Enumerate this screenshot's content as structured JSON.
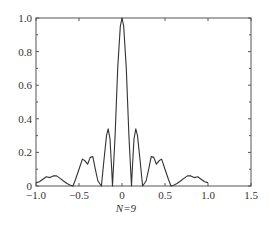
{
  "chart_data": {
    "type": "line",
    "title": "",
    "xlabel": "N=9",
    "ylabel": "",
    "xlim": [
      -1.0,
      1.5
    ],
    "ylim": [
      0,
      1.0
    ],
    "grid": false,
    "legend": null,
    "x_ticks": [
      -1.0,
      -0.5,
      0,
      0.5,
      1.0,
      1.5
    ],
    "x_tick_labels": [
      "−1.0",
      "−0.5",
      "0",
      "0.5",
      "1.0",
      "1.5"
    ],
    "y_ticks": [
      0,
      0.2,
      0.4,
      0.6,
      0.8,
      1.0
    ],
    "y_tick_labels": [
      "0",
      "0.2",
      "0.4",
      "0.6",
      "0.8",
      "1.0"
    ],
    "series": [
      {
        "name": "N=9",
        "color": "#333333",
        "x": [
          -1.0,
          -0.96,
          -0.92,
          -0.88,
          -0.84,
          -0.8,
          -0.76,
          -0.72,
          -0.68,
          -0.64,
          -0.6,
          -0.57,
          -0.54,
          -0.5,
          -0.46,
          -0.43,
          -0.4,
          -0.37,
          -0.34,
          -0.31,
          -0.28,
          -0.24,
          -0.21,
          -0.18,
          -0.16,
          -0.14,
          -0.12,
          -0.11,
          -0.08,
          -0.05,
          -0.02,
          0,
          0.02,
          0.05,
          0.08,
          0.11,
          0.12,
          0.14,
          0.16,
          0.18,
          0.21,
          0.24,
          0.28,
          0.31,
          0.34,
          0.37,
          0.4,
          0.43,
          0.46,
          0.5,
          0.54,
          0.57,
          0.6,
          0.64,
          0.68,
          0.72,
          0.76,
          0.8,
          0.84,
          0.88,
          0.92,
          0.96,
          1.0
        ],
        "y": [
          0.02,
          0.025,
          0.04,
          0.055,
          0.05,
          0.06,
          0.06,
          0.045,
          0.03,
          0.015,
          0.005,
          0.0,
          0.04,
          0.1,
          0.16,
          0.15,
          0.13,
          0.17,
          0.175,
          0.1,
          0.03,
          0.0,
          0.15,
          0.3,
          0.34,
          0.28,
          0.1,
          0.0,
          0.3,
          0.7,
          0.95,
          1.0,
          0.95,
          0.7,
          0.3,
          0.0,
          0.1,
          0.28,
          0.34,
          0.3,
          0.15,
          0.0,
          0.03,
          0.1,
          0.175,
          0.17,
          0.13,
          0.15,
          0.16,
          0.1,
          0.04,
          0.0,
          0.005,
          0.015,
          0.03,
          0.045,
          0.06,
          0.06,
          0.05,
          0.055,
          0.04,
          0.025,
          0.02
        ]
      }
    ]
  },
  "plot": {
    "left": 36,
    "top": 18,
    "right": 251,
    "bottom": 186
  },
  "xlabel_text": "N=9"
}
